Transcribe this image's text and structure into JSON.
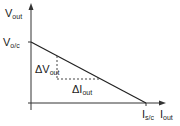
{
  "diagram": {
    "y_axis": {
      "label": "V",
      "label_sub": "out"
    },
    "x_axis": {
      "label": "I",
      "label_sub": "out"
    },
    "y_intercept": {
      "label": "V",
      "label_sub": "o/c"
    },
    "x_intercept": {
      "label": "I",
      "label_sub": "s/c"
    },
    "delta_v": {
      "label": "ΔV",
      "label_sub": "out"
    },
    "delta_i": {
      "label": "ΔI",
      "label_sub": "out"
    },
    "colors": {
      "line": "#222222",
      "dash": "#444444"
    }
  }
}
